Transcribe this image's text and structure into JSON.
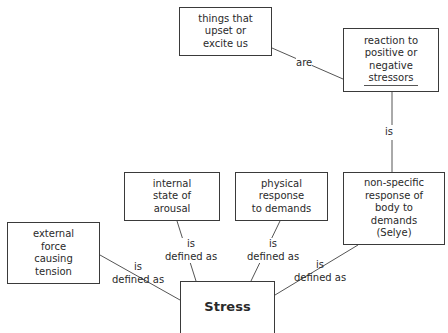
{
  "diagram": {
    "center": {
      "id": "stress",
      "label": "Stress"
    },
    "nodes": [
      {
        "id": "things",
        "lines": [
          "things that",
          "upset or",
          "excite us"
        ]
      },
      {
        "id": "reaction",
        "lines": [
          "reaction to",
          "positive or",
          "negative",
          "stressors"
        ]
      },
      {
        "id": "internal",
        "lines": [
          "internal",
          "state of",
          "arousal"
        ]
      },
      {
        "id": "physical",
        "lines": [
          "physical",
          "response",
          "to demands"
        ]
      },
      {
        "id": "nonspecific",
        "lines": [
          "non-specific",
          "response of",
          "body to",
          "demands",
          "(Selye)"
        ]
      },
      {
        "id": "external",
        "lines": [
          "external",
          "force",
          "causing",
          "tension"
        ]
      }
    ],
    "links": [
      {
        "from": "reaction",
        "to": "things",
        "label": "are"
      },
      {
        "from": "nonspecific",
        "to": "reaction",
        "label": "is"
      },
      {
        "from": "stress",
        "to": "external",
        "label_lines": [
          "is",
          "defined as"
        ]
      },
      {
        "from": "stress",
        "to": "internal",
        "label_lines": [
          "is",
          "defined as"
        ]
      },
      {
        "from": "stress",
        "to": "physical",
        "label_lines": [
          "is",
          "defined as"
        ]
      },
      {
        "from": "stress",
        "to": "nonspecific",
        "label_lines": [
          "is",
          "defined as"
        ]
      }
    ]
  }
}
